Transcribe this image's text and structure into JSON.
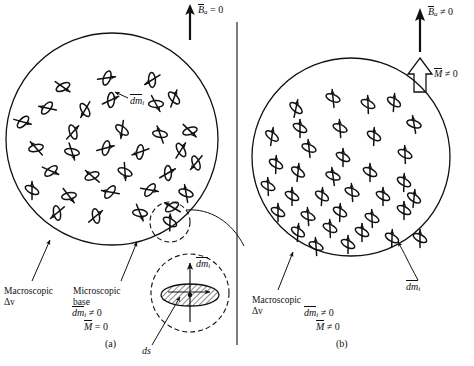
{
  "figure": {
    "title_hidden": "Magnetic dipole moments in a material volume",
    "type": "physics-diagram"
  },
  "panel_a": {
    "field_label_main": "B",
    "field_label_sub": "a",
    "field_label_rel": "= 0",
    "dm_label_main": "dm",
    "dm_label_sub": "i",
    "annot_macroscopic": "Macroscopic",
    "annot_macroscopic_2": "Δv",
    "annot_microscopic": "Microscopic",
    "annot_microscopic_2": "base",
    "inset_dm_main": "dm",
    "inset_dm_sub": "i",
    "inset_ds": "ds",
    "eq1_main": "dm",
    "eq1_sub": "i",
    "eq1_rel": "≠ 0",
    "eq2_main": "M",
    "eq2_rel": "= 0",
    "caption": "(a)"
  },
  "panel_b": {
    "field_label_main": "B",
    "field_label_sub": "a",
    "field_label_rel": "≠ 0",
    "mag_label_main": "M",
    "mag_label_rel": "≠ 0",
    "dm_label_main": "dm",
    "dm_label_sub": "i",
    "annot_macroscopic": "Macroscopic",
    "annot_macroscopic_2": "Δv",
    "eq1_main": "dm",
    "eq1_sub": "i",
    "eq1_rel": "≠ 0",
    "eq2_main": "M",
    "eq2_rel": "≠ 0",
    "caption": "(b)"
  },
  "colors": {
    "ink": "#111111",
    "paper": "#ffffff"
  }
}
